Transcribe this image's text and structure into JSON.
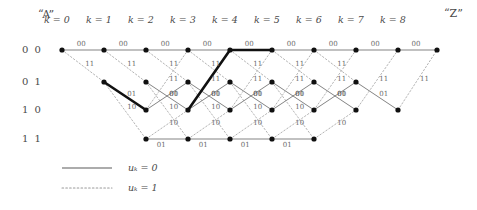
{
  "figure": {
    "type": "trellis-diagram",
    "start_label": "“A”",
    "end_label": "“Z”",
    "stage_labels": [
      "k = 0",
      "k = 1",
      "k = 2",
      "k = 3",
      "k = 4",
      "k = 5",
      "k = 6",
      "k = 7",
      "k = 8"
    ],
    "state_labels": [
      "0 0",
      "0 1",
      "1 0",
      "1 1"
    ],
    "legend": {
      "solid_label": "uₖ = 0",
      "dotted_label": "uₖ = 1",
      "solid_name": "solid-line-sample",
      "dotted_name": "dotted-line-sample"
    },
    "colors": {
      "line": "#6e6e6e",
      "bold_line": "#111111",
      "node": "#101010",
      "text": "#4a4a4a",
      "label": "#6a6a6a",
      "background": "#ffffff"
    }
  },
  "geometry": {
    "columns_x": [
      62,
      104,
      146,
      188,
      230,
      272,
      314,
      356,
      398,
      437
    ],
    "rows_y": [
      50,
      82,
      110,
      139
    ],
    "node_radius": 2.6
  },
  "chart_data": {
    "type": "trellis",
    "states": [
      "00",
      "01",
      "10",
      "11"
    ],
    "stages": 9,
    "transitions": [
      {
        "from_col": 0,
        "from_state": 0,
        "to_col": 1,
        "to_state": 0,
        "input": 0,
        "output": "00",
        "bold": false
      },
      {
        "from_col": 0,
        "from_state": 0,
        "to_col": 1,
        "to_state": 1,
        "input": 1,
        "output": "11",
        "bold": false
      },
      {
        "from_col": 1,
        "from_state": 0,
        "to_col": 2,
        "to_state": 0,
        "input": 0,
        "output": "00",
        "bold": false
      },
      {
        "from_col": 1,
        "from_state": 0,
        "to_col": 2,
        "to_state": 1,
        "input": 1,
        "output": "11",
        "bold": false
      },
      {
        "from_col": 1,
        "from_state": 1,
        "to_col": 2,
        "to_state": 2,
        "input": 0,
        "output": "01",
        "bold": true
      },
      {
        "from_col": 1,
        "from_state": 1,
        "to_col": 2,
        "to_state": 3,
        "input": 1,
        "output": "10",
        "bold": false
      },
      {
        "from_col": 2,
        "from_state": 0,
        "to_col": 3,
        "to_state": 0,
        "input": 0,
        "output": "00",
        "bold": false
      },
      {
        "from_col": 2,
        "from_state": 0,
        "to_col": 3,
        "to_state": 1,
        "input": 1,
        "output": "11",
        "bold": false
      },
      {
        "from_col": 2,
        "from_state": 1,
        "to_col": 3,
        "to_state": 2,
        "input": 0,
        "output": "01",
        "bold": false
      },
      {
        "from_col": 2,
        "from_state": 1,
        "to_col": 3,
        "to_state": 3,
        "input": 1,
        "output": "10",
        "bold": false
      },
      {
        "from_col": 2,
        "from_state": 2,
        "to_col": 3,
        "to_state": 0,
        "input": 1,
        "output": "11",
        "bold": false
      },
      {
        "from_col": 2,
        "from_state": 2,
        "to_col": 3,
        "to_state": 1,
        "input": 0,
        "output": "00",
        "bold": false
      },
      {
        "from_col": 2,
        "from_state": 3,
        "to_col": 3,
        "to_state": 2,
        "input": 1,
        "output": "10",
        "bold": false
      },
      {
        "from_col": 2,
        "from_state": 3,
        "to_col": 3,
        "to_state": 3,
        "input": 0,
        "output": "01",
        "bold": false
      },
      {
        "from_col": 3,
        "from_state": 0,
        "to_col": 4,
        "to_state": 0,
        "input": 0,
        "output": "00",
        "bold": false
      },
      {
        "from_col": 3,
        "from_state": 0,
        "to_col": 4,
        "to_state": 1,
        "input": 1,
        "output": "11",
        "bold": false
      },
      {
        "from_col": 3,
        "from_state": 1,
        "to_col": 4,
        "to_state": 2,
        "input": 0,
        "output": "01",
        "bold": false
      },
      {
        "from_col": 3,
        "from_state": 1,
        "to_col": 4,
        "to_state": 3,
        "input": 1,
        "output": "10",
        "bold": false
      },
      {
        "from_col": 3,
        "from_state": 2,
        "to_col": 4,
        "to_state": 0,
        "input": 1,
        "output": "11",
        "bold": true
      },
      {
        "from_col": 3,
        "from_state": 2,
        "to_col": 4,
        "to_state": 1,
        "input": 0,
        "output": "00",
        "bold": false
      },
      {
        "from_col": 3,
        "from_state": 3,
        "to_col": 4,
        "to_state": 2,
        "input": 1,
        "output": "10",
        "bold": false
      },
      {
        "from_col": 3,
        "from_state": 3,
        "to_col": 4,
        "to_state": 3,
        "input": 0,
        "output": "01",
        "bold": false
      },
      {
        "from_col": 4,
        "from_state": 0,
        "to_col": 5,
        "to_state": 0,
        "input": 0,
        "output": "00",
        "bold": true
      },
      {
        "from_col": 4,
        "from_state": 0,
        "to_col": 5,
        "to_state": 1,
        "input": 1,
        "output": "11",
        "bold": false
      },
      {
        "from_col": 4,
        "from_state": 1,
        "to_col": 5,
        "to_state": 2,
        "input": 0,
        "output": "01",
        "bold": false
      },
      {
        "from_col": 4,
        "from_state": 1,
        "to_col": 5,
        "to_state": 3,
        "input": 1,
        "output": "10",
        "bold": false
      },
      {
        "from_col": 4,
        "from_state": 2,
        "to_col": 5,
        "to_state": 0,
        "input": 1,
        "output": "11",
        "bold": false
      },
      {
        "from_col": 4,
        "from_state": 2,
        "to_col": 5,
        "to_state": 1,
        "input": 0,
        "output": "00",
        "bold": false
      },
      {
        "from_col": 4,
        "from_state": 3,
        "to_col": 5,
        "to_state": 2,
        "input": 1,
        "output": "10",
        "bold": false
      },
      {
        "from_col": 4,
        "from_state": 3,
        "to_col": 5,
        "to_state": 3,
        "input": 0,
        "output": "01",
        "bold": false
      },
      {
        "from_col": 5,
        "from_state": 0,
        "to_col": 6,
        "to_state": 0,
        "input": 0,
        "output": "00",
        "bold": false
      },
      {
        "from_col": 5,
        "from_state": 0,
        "to_col": 6,
        "to_state": 1,
        "input": 1,
        "output": "11",
        "bold": false
      },
      {
        "from_col": 5,
        "from_state": 1,
        "to_col": 6,
        "to_state": 2,
        "input": 0,
        "output": "01",
        "bold": false
      },
      {
        "from_col": 5,
        "from_state": 1,
        "to_col": 6,
        "to_state": 3,
        "input": 1,
        "output": "10",
        "bold": false
      },
      {
        "from_col": 5,
        "from_state": 2,
        "to_col": 6,
        "to_state": 0,
        "input": 1,
        "output": "11",
        "bold": false
      },
      {
        "from_col": 5,
        "from_state": 2,
        "to_col": 6,
        "to_state": 1,
        "input": 0,
        "output": "00",
        "bold": false
      },
      {
        "from_col": 5,
        "from_state": 3,
        "to_col": 6,
        "to_state": 2,
        "input": 1,
        "output": "10",
        "bold": false
      },
      {
        "from_col": 5,
        "from_state": 3,
        "to_col": 6,
        "to_state": 3,
        "input": 0,
        "output": "01",
        "bold": false
      },
      {
        "from_col": 6,
        "from_state": 0,
        "to_col": 7,
        "to_state": 0,
        "input": 0,
        "output": "00",
        "bold": false
      },
      {
        "from_col": 6,
        "from_state": 0,
        "to_col": 7,
        "to_state": 1,
        "input": 1,
        "output": "11",
        "bold": false
      },
      {
        "from_col": 6,
        "from_state": 1,
        "to_col": 7,
        "to_state": 2,
        "input": 0,
        "output": "01",
        "bold": false
      },
      {
        "from_col": 6,
        "from_state": 2,
        "to_col": 7,
        "to_state": 0,
        "input": 1,
        "output": "11",
        "bold": false
      },
      {
        "from_col": 6,
        "from_state": 2,
        "to_col": 7,
        "to_state": 1,
        "input": 0,
        "output": "00",
        "bold": false
      },
      {
        "from_col": 6,
        "from_state": 3,
        "to_col": 7,
        "to_state": 2,
        "input": 1,
        "output": "10",
        "bold": false
      },
      {
        "from_col": 7,
        "from_state": 0,
        "to_col": 8,
        "to_state": 0,
        "input": 0,
        "output": "00",
        "bold": false
      },
      {
        "from_col": 7,
        "from_state": 1,
        "to_col": 8,
        "to_state": 2,
        "input": 0,
        "output": "01",
        "bold": false
      },
      {
        "from_col": 7,
        "from_state": 2,
        "to_col": 8,
        "to_state": 0,
        "input": 1,
        "output": "11",
        "bold": false
      },
      {
        "from_col": 8,
        "from_state": 0,
        "to_col": 9,
        "to_state": 0,
        "input": 0,
        "output": "00",
        "bold": false
      },
      {
        "from_col": 8,
        "from_state": 2,
        "to_col": 9,
        "to_state": 0,
        "input": 1,
        "output": "11",
        "bold": false
      }
    ],
    "nodes": [
      {
        "col": 0,
        "state": 0
      },
      {
        "col": 1,
        "state": 0
      },
      {
        "col": 1,
        "state": 1
      },
      {
        "col": 2,
        "state": 0
      },
      {
        "col": 2,
        "state": 1
      },
      {
        "col": 2,
        "state": 2
      },
      {
        "col": 2,
        "state": 3
      },
      {
        "col": 3,
        "state": 0
      },
      {
        "col": 3,
        "state": 1
      },
      {
        "col": 3,
        "state": 2
      },
      {
        "col": 3,
        "state": 3
      },
      {
        "col": 4,
        "state": 0
      },
      {
        "col": 4,
        "state": 1
      },
      {
        "col": 4,
        "state": 2
      },
      {
        "col": 4,
        "state": 3
      },
      {
        "col": 5,
        "state": 0
      },
      {
        "col": 5,
        "state": 1
      },
      {
        "col": 5,
        "state": 2
      },
      {
        "col": 5,
        "state": 3
      },
      {
        "col": 6,
        "state": 0
      },
      {
        "col": 6,
        "state": 1
      },
      {
        "col": 6,
        "state": 2
      },
      {
        "col": 6,
        "state": 3
      },
      {
        "col": 7,
        "state": 0
      },
      {
        "col": 7,
        "state": 1
      },
      {
        "col": 7,
        "state": 2
      },
      {
        "col": 8,
        "state": 0
      },
      {
        "col": 8,
        "state": 2
      },
      {
        "col": 9,
        "state": 0
      }
    ],
    "survivor_path_states": [
      "00",
      "01",
      "10",
      "10",
      "00",
      "00"
    ],
    "legend_entries": [
      {
        "style": "solid",
        "label": "uₖ = 0"
      },
      {
        "style": "dotted",
        "label": "uₖ = 1"
      }
    ]
  }
}
